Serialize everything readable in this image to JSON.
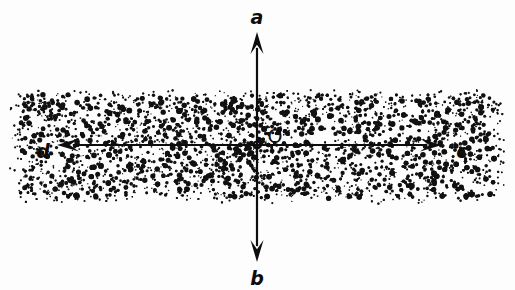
{
  "figure": {
    "kind": "ray-diagram",
    "background_color": "#fdfdfd",
    "ink_color": "#0d0d0d",
    "width": 515,
    "height": 290
  },
  "medium_band": {
    "name": "stippled-medium",
    "fill_pattern": "stipple-dots",
    "dot_color": "#111111",
    "top_y": 88,
    "bottom_y": 205,
    "left_x": 6,
    "right_x": 509,
    "core_top_y": 100,
    "core_bottom_y": 193
  },
  "origin": {
    "label": "O",
    "label_x": 275,
    "label_y": 137,
    "point_x": 257,
    "point_y": 145,
    "point_radius": 3.4,
    "name": "origin-point"
  },
  "rays": [
    {
      "id": "ray-a",
      "label": "a",
      "direction": "up",
      "label_x": 257,
      "label_y": 18,
      "tail_x": 257,
      "tail_y": 145,
      "tip_x": 257,
      "tip_y": 32
    },
    {
      "id": "ray-b",
      "label": "b",
      "direction": "down",
      "label_x": 257,
      "label_y": 279,
      "tail_x": 257,
      "tail_y": 145,
      "tip_x": 257,
      "tip_y": 262
    },
    {
      "id": "ray-c",
      "label": "c",
      "direction": "right",
      "label_x": 462,
      "label_y": 152,
      "tail_x": 257,
      "tail_y": 145,
      "tip_x": 442,
      "tip_y": 145
    },
    {
      "id": "ray-d",
      "label": "d",
      "direction": "left",
      "label_x": 43,
      "label_y": 152,
      "tail_x": 257,
      "tail_y": 145,
      "tip_x": 57,
      "tip_y": 145
    }
  ],
  "stroke": {
    "line_width": 2.2,
    "arrow_half_width": 6.5,
    "arrow_length": 22
  }
}
